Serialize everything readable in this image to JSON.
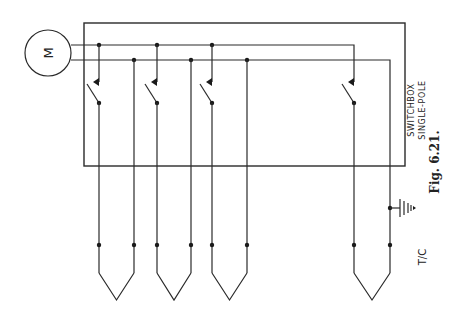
{
  "figure": {
    "caption": "Fig. 6.21.",
    "motor_label": "M",
    "switchbox_label_line1": "SWITCHBOX",
    "switchbox_label_line2": "SINGLE-POLE",
    "thermocouple_label": "T/C"
  },
  "colors": {
    "line": "#2a2a2a",
    "background": "#ffffff"
  },
  "components": {
    "motor_count": 1,
    "switch_count": 4,
    "thermocouple_count": 4,
    "earth_symbol_count": 1
  }
}
